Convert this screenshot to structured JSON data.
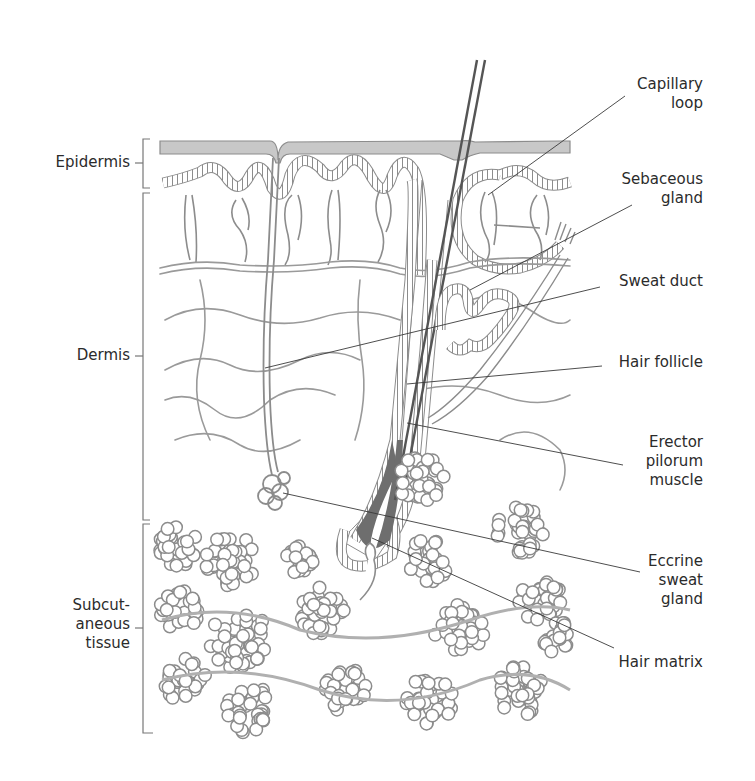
{
  "diagram": {
    "type": "anatomical-cross-section",
    "colors": {
      "line": "#8c8c8c",
      "dark_line": "#555555",
      "hair_fill": "#6e6e6e",
      "stratum_fill": "#c8c8c8",
      "leader": "#3a3a3a",
      "text": "#2b2b2b"
    },
    "layers": [
      {
        "id": "epidermis",
        "label": "Epidermis"
      },
      {
        "id": "dermis",
        "label": "Dermis"
      },
      {
        "id": "subcutaneous",
        "label": "Subcut-\naneous\ntissue"
      }
    ],
    "structures": [
      {
        "id": "capillary-loop",
        "label": "Capillary\nloop"
      },
      {
        "id": "sebaceous-gland",
        "label": "Sebaceous\ngland"
      },
      {
        "id": "sweat-duct",
        "label": "Sweat duct"
      },
      {
        "id": "hair-follicle",
        "label": "Hair follicle"
      },
      {
        "id": "erector-pilorum",
        "label": "Erector\npilorum\nmuscle"
      },
      {
        "id": "eccrine-sweat-gland",
        "label": "Eccrine\nsweat\ngland"
      },
      {
        "id": "hair-matrix",
        "label": "Hair matrix"
      }
    ]
  }
}
